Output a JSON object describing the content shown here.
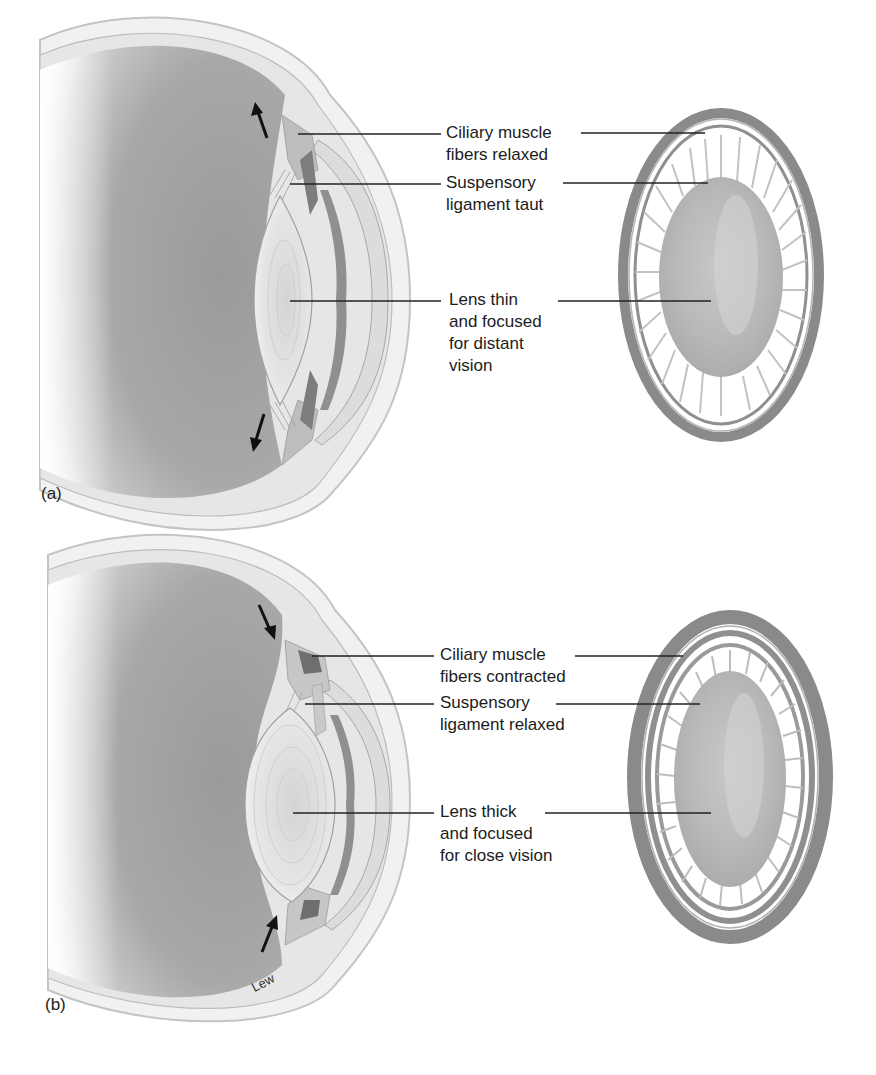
{
  "figure": {
    "panels": [
      {
        "id": "a",
        "letter": "(a)",
        "state": "distant-vision",
        "labels": [
          {
            "line1": "Ciliary muscle",
            "line2": "fibers relaxed"
          },
          {
            "line1": "Suspensory",
            "line2": "ligament taut"
          },
          {
            "line1": "Lens thin",
            "line2": "and focused",
            "line3": "for distant",
            "line4": "vision"
          }
        ]
      },
      {
        "id": "b",
        "letter": "(b)",
        "state": "close-vision",
        "labels": [
          {
            "line1": "Ciliary muscle",
            "line2": "fibers contracted"
          },
          {
            "line1": "Suspensory",
            "line2": "ligament relaxed"
          },
          {
            "line1": "Lens thick",
            "line2": "and focused",
            "line3": "for close vision"
          }
        ]
      }
    ],
    "signature": "Lew",
    "colors": {
      "background": "#ffffff",
      "vitreous": "#9c9c9c",
      "sclera": "#e4e4e4",
      "lens": "#d8d8d8",
      "ring": "#8a8a8a",
      "leader": "#222222",
      "arrow": "#111111"
    }
  }
}
